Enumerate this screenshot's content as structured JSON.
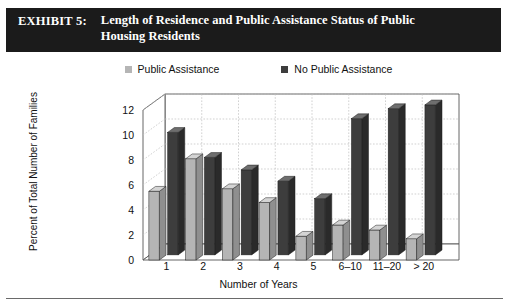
{
  "exhibit": {
    "label": "EXHIBIT 5:",
    "title": "Length of Residence and Public Assistance Status of Public Housing Residents",
    "title_line1": "Length of Residence and Public Assistance Status of Public",
    "title_line2": "Housing Residents"
  },
  "legend": [
    {
      "label": "Public Assistance",
      "color": "#b5b5b5",
      "icon": "square-swatch-icon"
    },
    {
      "label": "No Public Assistance",
      "color": "#3d3d3d",
      "icon": "square-swatch-icon"
    }
  ],
  "colors": {
    "series_light": "#b5b5b5",
    "series_light_top": "#d4d4d4",
    "series_light_side": "#8f8f8f",
    "series_dark": "#3d3d3d",
    "series_dark_top": "#6e6e6e",
    "series_dark_side": "#2a2a2a",
    "title_background": "#1b1b1b",
    "title_text": "#ffffff",
    "grid": "#bdbdbd",
    "axis": "#555555",
    "floor": "#ffffff",
    "page_background": "#ffffff"
  },
  "chart_data": {
    "type": "bar",
    "title": "Length of Residence and Public Assistance Status of Public Housing Residents",
    "xlabel": "Number of Years",
    "ylabel": "Percent of Total Number of Families",
    "categories": [
      "1",
      "2",
      "3",
      "4",
      "5",
      "6–10",
      "11–20",
      "> 20"
    ],
    "yticks": [
      0,
      2,
      4,
      6,
      8,
      10,
      12
    ],
    "ylim": [
      0,
      12
    ],
    "grid": true,
    "legend_position": "top",
    "three_d": true,
    "series": [
      {
        "name": "Public Assistance",
        "color": "#b5b5b5",
        "values": [
          5.5,
          8.1,
          5.7,
          4.6,
          1.9,
          2.8,
          2.4,
          1.7
        ]
      },
      {
        "name": "No Public Assistance",
        "color": "#3d3d3d",
        "values": [
          9.8,
          7.8,
          6.8,
          5.9,
          4.5,
          10.9,
          11.7,
          12.0
        ]
      }
    ]
  }
}
